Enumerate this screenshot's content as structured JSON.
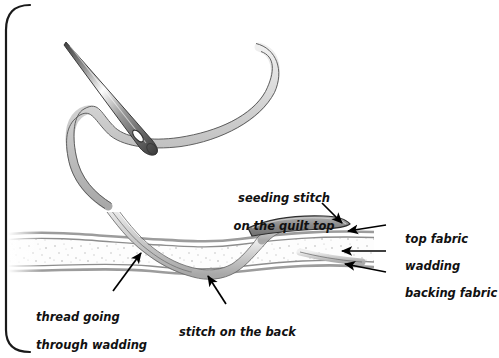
{
  "figure": {
    "border_color": "#1a1a1a",
    "background": "#ffffff"
  },
  "colors": {
    "thread": "#c9c9c9",
    "thread_outline": "#555555",
    "needle_light": "#ffffff",
    "needle_dark": "#4a4a4a",
    "fabric_line": "#8d8d8d",
    "wadding_fill": "#fcfcfc",
    "wadding_speckle": "#b9b9b9",
    "top_stitch": "#9a9a9a",
    "top_stitch_outline": "#2e2e2e",
    "text": "#111111",
    "arrow": "#000000"
  },
  "labels": [
    {
      "id": "seeding-stitch",
      "text_line1": "seeding stitch",
      "text_line2": "on the quilt top",
      "x": 216,
      "y": 177,
      "align": "center",
      "arrow_from": [
        322,
        204
      ],
      "arrow_to": [
        341,
        222
      ]
    },
    {
      "id": "top-fabric",
      "text_line1": "top fabric",
      "text_line2": "",
      "x": 389,
      "y": 218,
      "align": "left",
      "arrow_from": [
        386,
        226
      ],
      "arrow_to": [
        347,
        231
      ]
    },
    {
      "id": "wadding",
      "text_line1": "wadding",
      "text_line2": "",
      "x": 389,
      "y": 246,
      "align": "left",
      "arrow_from": [
        386,
        251
      ],
      "arrow_to": [
        341,
        251
      ]
    },
    {
      "id": "backing-fabric",
      "text_line1": "backing fabric",
      "text_line2": "",
      "x": 389,
      "y": 275,
      "align": "left",
      "arrow_from": [
        386,
        273
      ],
      "arrow_to": [
        344,
        265
      ]
    },
    {
      "id": "thread-going-through-wadding",
      "text_line1": "thread going",
      "text_line2": "through wadding",
      "x": 20,
      "y": 296,
      "align": "left",
      "arrow_from": [
        113,
        291
      ],
      "arrow_to": [
        140,
        254
      ]
    },
    {
      "id": "stitch-on-the-back",
      "text_line1": "stitch on the back",
      "text_line2": "",
      "x": 163,
      "y": 311,
      "align": "left",
      "arrow_from": [
        226,
        305
      ],
      "arrow_to": [
        207,
        275
      ]
    }
  ],
  "elements": {
    "needle": "sewing-needle",
    "thread": "curved-thread",
    "quilt_top": "top-fabric-layer",
    "quilt_wadding": "wadding-layer",
    "quilt_backing": "backing-fabric-layer",
    "seeding_stitch": "seeding-stitch-on-top"
  }
}
